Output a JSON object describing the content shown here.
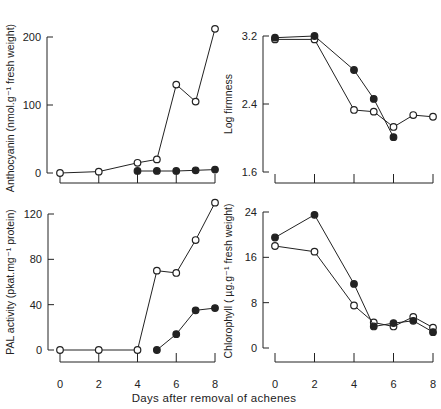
{
  "figure": {
    "xlabel": "Days after removal of achenes",
    "ink_color": "#222222",
    "background": "#ffffff"
  },
  "chart_data": [
    {
      "id": "anthocyanin",
      "type": "line",
      "title": "",
      "xlabel": "",
      "ylabel": "Anthocyanin (nmol.g⁻¹ fresh weight)",
      "xticks": [
        0,
        2,
        4,
        6,
        8
      ],
      "show_xtick_labels": false,
      "yticks": [
        0,
        100,
        200
      ],
      "ytick_labels": [
        "0",
        "100",
        "200"
      ],
      "xlim": [
        0,
        8
      ],
      "ylim": [
        0,
        200
      ],
      "grid": false,
      "series": [
        {
          "name": "open circles",
          "marker": "open",
          "x": [
            0,
            2,
            4,
            5,
            6,
            7,
            8
          ],
          "values": [
            0,
            2,
            15,
            20,
            130,
            105,
            212
          ]
        },
        {
          "name": "filled circles",
          "marker": "filled",
          "x": [
            4,
            5,
            6,
            7,
            8
          ],
          "values": [
            3,
            3,
            3,
            4,
            5
          ]
        }
      ]
    },
    {
      "id": "firmness",
      "type": "line",
      "title": "",
      "xlabel": "",
      "ylabel": "Log firmness",
      "xticks": [
        0,
        2,
        4,
        6,
        8
      ],
      "show_xtick_labels": false,
      "yticks": [
        1.6,
        2.4,
        3.2
      ],
      "ytick_labels": [
        "1.6",
        "2.4",
        "3.2"
      ],
      "xlim": [
        0,
        8
      ],
      "ylim": [
        1.6,
        3.2
      ],
      "grid": false,
      "series": [
        {
          "name": "open circles",
          "marker": "open",
          "x": [
            0,
            2,
            4,
            5,
            6,
            7,
            8
          ],
          "values": [
            3.16,
            3.16,
            2.33,
            2.31,
            2.13,
            2.27,
            2.25
          ]
        },
        {
          "name": "filled circles",
          "marker": "filled",
          "x": [
            0,
            2,
            4,
            5,
            6
          ],
          "values": [
            3.18,
            3.2,
            2.8,
            2.46,
            2.01
          ]
        }
      ]
    },
    {
      "id": "pal",
      "type": "line",
      "title": "",
      "xlabel": "",
      "ylabel": "PAL activity (pkat.mg⁻¹ protein)",
      "xticks": [
        0,
        2,
        4,
        6,
        8
      ],
      "show_xtick_labels": true,
      "xtick_labels": [
        "0",
        "2",
        "4",
        "6",
        "8"
      ],
      "yticks": [
        0,
        40,
        80,
        120
      ],
      "ytick_labels": [
        "0",
        "40",
        "80",
        "120"
      ],
      "xlim": [
        0,
        8
      ],
      "ylim": [
        0,
        120
      ],
      "grid": false,
      "series": [
        {
          "name": "open circles",
          "marker": "open",
          "x": [
            0,
            2,
            4,
            5,
            6,
            7,
            8
          ],
          "values": [
            0,
            0,
            0,
            70,
            68,
            97,
            130
          ]
        },
        {
          "name": "filled circles",
          "marker": "filled",
          "x": [
            5,
            6,
            7,
            8
          ],
          "values": [
            0,
            14,
            35,
            37
          ]
        }
      ]
    },
    {
      "id": "chlorophyll",
      "type": "line",
      "title": "",
      "xlabel": "",
      "ylabel": "Chlorophyll ( µg.g⁻¹ fresh weight)",
      "xticks": [
        0,
        2,
        4,
        6,
        8
      ],
      "show_xtick_labels": true,
      "xtick_labels": [
        "0",
        "2",
        "4",
        "6",
        "8"
      ],
      "yticks": [
        0,
        8,
        16,
        24
      ],
      "ytick_labels": [
        "0",
        "8",
        "16",
        "24"
      ],
      "xlim": [
        0,
        8
      ],
      "ylim": [
        0,
        24
      ],
      "grid": false,
      "series": [
        {
          "name": "open circles",
          "marker": "open",
          "x": [
            0,
            2,
            4,
            5,
            6,
            7,
            8
          ],
          "values": [
            18,
            17,
            7.5,
            4.5,
            3.8,
            5.5,
            3.6
          ]
        },
        {
          "name": "filled circles",
          "marker": "filled",
          "x": [
            0,
            2,
            4,
            5,
            6,
            7,
            8
          ],
          "values": [
            19.5,
            23.5,
            11.3,
            3.8,
            4.4,
            4.8,
            2.8
          ]
        }
      ]
    }
  ]
}
